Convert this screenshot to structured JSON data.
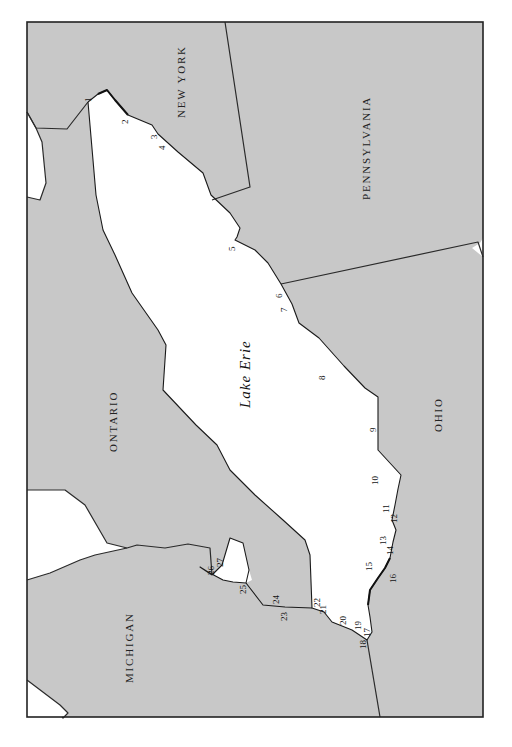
{
  "map": {
    "lake_label": "Lake Erie",
    "regions": [
      {
        "id": "new-york",
        "label": "NEW YORK"
      },
      {
        "id": "pennsylvania",
        "label": "PENNSYLVANIA"
      },
      {
        "id": "ontario",
        "label": "ONTARIO"
      },
      {
        "id": "ohio",
        "label": "OHIO"
      },
      {
        "id": "michigan",
        "label": "MICHIGAN"
      }
    ],
    "points": [
      "1",
      "2",
      "3",
      "4",
      "5",
      "6",
      "7",
      "8",
      "9",
      "10",
      "11",
      "12",
      "13",
      "14",
      "15",
      "16",
      "17",
      "18",
      "19",
      "20",
      "21",
      "22",
      "23",
      "24",
      "25",
      "26",
      "27"
    ],
    "colors": {
      "land": "#c8c8c8",
      "water": "#ffffff",
      "border": "#2a2a2a"
    }
  }
}
